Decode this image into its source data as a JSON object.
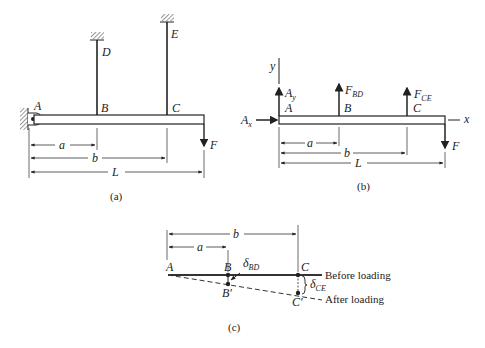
{
  "figure_a": {
    "caption": "(a)",
    "points": {
      "A": "A",
      "B": "B",
      "C": "C",
      "D": "D",
      "E": "E"
    },
    "load": "F",
    "dims": {
      "a": "a",
      "b": "b",
      "L": "L"
    }
  },
  "figure_b": {
    "caption": "(b)",
    "points": {
      "A": "A",
      "B": "B",
      "C": "C"
    },
    "axes": {
      "x": "x",
      "y": "y"
    },
    "forces": {
      "Ax": {
        "main": "A",
        "sub": "x"
      },
      "Ay": {
        "main": "A",
        "sub": "y"
      },
      "FBD": {
        "main": "F",
        "sub": "BD"
      },
      "FCE": {
        "main": "F",
        "sub": "CE"
      },
      "F": "F"
    },
    "dims": {
      "a": "a",
      "b": "b",
      "L": "L"
    }
  },
  "figure_c": {
    "caption": "(c)",
    "points": {
      "A": "A",
      "B": "B",
      "C": "C",
      "B_prime": "B′",
      "C_prime": "C′"
    },
    "deflections": {
      "dBD": {
        "main": "δ",
        "sub": "BD"
      },
      "dCE": {
        "main": "δ",
        "sub": "CE"
      }
    },
    "labels": {
      "before": "Before loading",
      "after": "After loading"
    },
    "dims": {
      "a": "a",
      "b": "b"
    }
  }
}
